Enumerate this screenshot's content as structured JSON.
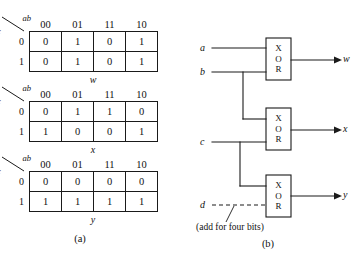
{
  "figure": {
    "caption_a": "(a)",
    "caption_b": "(b)",
    "note": "(add for four bits)"
  },
  "kmaps": [
    {
      "var_top": "ab",
      "var_side": "c",
      "col_headers": [
        "00",
        "01",
        "11",
        "10"
      ],
      "row_headers": [
        "0",
        "1"
      ],
      "rows": [
        [
          "0",
          "1",
          "0",
          "1"
        ],
        [
          "0",
          "1",
          "0",
          "1"
        ]
      ],
      "output": "w"
    },
    {
      "var_top": "ab",
      "var_side": "c",
      "col_headers": [
        "00",
        "01",
        "11",
        "10"
      ],
      "row_headers": [
        "0",
        "1"
      ],
      "rows": [
        [
          "0",
          "1",
          "1",
          "0"
        ],
        [
          "1",
          "0",
          "0",
          "1"
        ]
      ],
      "output": "x"
    },
    {
      "var_top": "ab",
      "var_side": "c",
      "col_headers": [
        "00",
        "01",
        "11",
        "10"
      ],
      "row_headers": [
        "0",
        "1"
      ],
      "rows": [
        [
          "0",
          "0",
          "0",
          "0"
        ],
        [
          "1",
          "1",
          "1",
          "1"
        ]
      ],
      "output": "y"
    }
  ],
  "circuit": {
    "inputs": [
      {
        "name": "a"
      },
      {
        "name": "b"
      },
      {
        "name": "c"
      },
      {
        "name": "d"
      }
    ],
    "outputs": [
      {
        "name": "w"
      },
      {
        "name": "x"
      },
      {
        "name": "y"
      }
    ],
    "gates": [
      {
        "type": "XOR",
        "l1": "X",
        "l2": "O",
        "l3": "R"
      },
      {
        "type": "XOR",
        "l1": "X",
        "l2": "O",
        "l3": "R"
      },
      {
        "type": "XOR",
        "l1": "X",
        "l2": "O",
        "l3": "R"
      }
    ]
  }
}
